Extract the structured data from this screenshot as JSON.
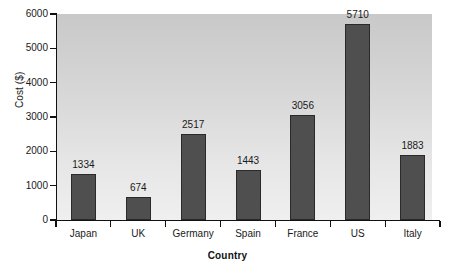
{
  "chart_data": {
    "type": "bar",
    "title": "",
    "subtitle": "",
    "xlabel": "Country",
    "ylabel": "Cost ($)",
    "categories": [
      "Japan",
      "UK",
      "Germany",
      "Spain",
      "France",
      "US",
      "Italy"
    ],
    "values": [
      1334,
      674,
      2517,
      1443,
      3056,
      5710,
      1883
    ],
    "value_labels": [
      "1334",
      "674",
      "2517",
      "1443",
      "3056",
      "5710",
      "1883"
    ],
    "ylim": [
      0,
      6000
    ],
    "ytick_labels": [
      "0",
      "1000",
      "2000",
      "3000",
      "4000",
      "5000",
      "6000"
    ],
    "ytick_values": [
      0,
      1000,
      2000,
      3000,
      4000,
      5000,
      6000
    ],
    "grid": false,
    "legend": null,
    "legend_position": "none",
    "colors": {
      "bar_fill": "#4f4f4f",
      "bar_border": "#2a2a2a",
      "plot_background_top": "#c9c9c9",
      "plot_background_bottom": "#efefef",
      "axis": "#111111",
      "text": "#1a1a1a",
      "figure_background": "#ffffff"
    }
  }
}
